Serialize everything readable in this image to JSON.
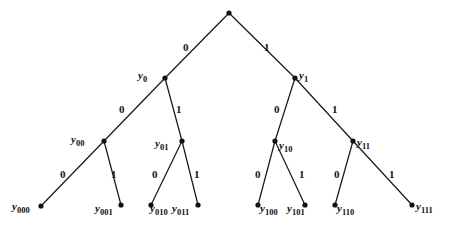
{
  "figure": {
    "type": "binary-tree-diagram",
    "background_color": "#ffffff",
    "line_color": "#1a1a1a",
    "node_color": "#111111",
    "width": 452,
    "height": 233
  },
  "nodes": [
    {
      "id": "root",
      "label": "",
      "sub": "",
      "x": 229,
      "y": 13,
      "label_x": 0,
      "label_y": 0,
      "level": 0
    },
    {
      "id": "y0",
      "label": "y",
      "sub": "0",
      "x": 165,
      "y": 78,
      "label_x": 138,
      "label_y": 70,
      "level": 1
    },
    {
      "id": "y1",
      "label": "y",
      "sub": "1",
      "x": 295,
      "y": 78,
      "label_x": 299,
      "label_y": 70,
      "level": 1
    },
    {
      "id": "y00",
      "label": "y",
      "sub": "00",
      "x": 104,
      "y": 141,
      "label_x": 71,
      "label_y": 134,
      "level": 2
    },
    {
      "id": "y01",
      "label": "y",
      "sub": "01",
      "x": 182,
      "y": 141,
      "label_x": 155,
      "label_y": 138,
      "level": 2
    },
    {
      "id": "y10",
      "label": "y",
      "sub": "10",
      "x": 275,
      "y": 141,
      "label_x": 279,
      "label_y": 140,
      "level": 2
    },
    {
      "id": "y11",
      "label": "y",
      "sub": "11",
      "x": 353,
      "y": 141,
      "label_x": 357,
      "label_y": 137,
      "level": 2
    },
    {
      "id": "y000",
      "label": "y",
      "sub": "000",
      "x": 41,
      "y": 206,
      "label_x": 12,
      "label_y": 201,
      "level": 3
    },
    {
      "id": "y001",
      "label": "y",
      "sub": "001",
      "x": 121,
      "y": 205,
      "label_x": 95,
      "label_y": 203,
      "level": 3
    },
    {
      "id": "y010",
      "label": "y",
      "sub": "010",
      "x": 151,
      "y": 205,
      "label_x": 150,
      "label_y": 203,
      "level": 3
    },
    {
      "id": "y011",
      "label": "y",
      "sub": "011",
      "x": 198,
      "y": 205,
      "label_x": 172,
      "label_y": 203,
      "level": 3
    },
    {
      "id": "y100",
      "label": "y",
      "sub": "100",
      "x": 258,
      "y": 205,
      "label_x": 260,
      "label_y": 203,
      "level": 3
    },
    {
      "id": "y101",
      "label": "y",
      "sub": "101",
      "x": 305,
      "y": 205,
      "label_x": 287,
      "label_y": 203,
      "level": 3
    },
    {
      "id": "y110",
      "label": "y",
      "sub": "110",
      "x": 335,
      "y": 205,
      "label_x": 337,
      "label_y": 203,
      "level": 3
    },
    {
      "id": "y111",
      "label": "y",
      "sub": "111",
      "x": 412,
      "y": 205,
      "label_x": 416,
      "label_y": 201,
      "level": 3
    }
  ],
  "edges": [
    {
      "id": "e-root-y0",
      "from": "root",
      "to": "y0",
      "label": "0",
      "x1": 229,
      "y1": 13,
      "x2": 165,
      "y2": 78,
      "label_x": 183,
      "label_y": 42
    },
    {
      "id": "e-root-y1",
      "from": "root",
      "to": "y1",
      "label": "1",
      "x1": 229,
      "y1": 13,
      "x2": 295,
      "y2": 78,
      "label_x": 264,
      "label_y": 42
    },
    {
      "id": "e-y0-y00",
      "from": "y0",
      "to": "y00",
      "label": "0",
      "x1": 165,
      "y1": 78,
      "x2": 104,
      "y2": 141,
      "label_x": 119,
      "label_y": 104
    },
    {
      "id": "e-y0-y01",
      "from": "y0",
      "to": "y01",
      "label": "1",
      "x1": 165,
      "y1": 78,
      "x2": 182,
      "y2": 141,
      "label_x": 176,
      "label_y": 104
    },
    {
      "id": "e-y1-y10",
      "from": "y1",
      "to": "y10",
      "label": "0",
      "x1": 295,
      "y1": 78,
      "x2": 275,
      "y2": 141,
      "label_x": 274,
      "label_y": 104
    },
    {
      "id": "e-y1-y11",
      "from": "y1",
      "to": "y11",
      "label": "1",
      "x1": 295,
      "y1": 78,
      "x2": 353,
      "y2": 141,
      "label_x": 332,
      "label_y": 104
    },
    {
      "id": "e-y00-y000",
      "from": "y00",
      "to": "y000",
      "label": "0",
      "x1": 104,
      "y1": 141,
      "x2": 41,
      "y2": 206,
      "label_x": 60,
      "label_y": 169
    },
    {
      "id": "e-y00-y001",
      "from": "y00",
      "to": "y001",
      "label": "1",
      "x1": 104,
      "y1": 141,
      "x2": 121,
      "y2": 205,
      "label_x": 111,
      "label_y": 169
    },
    {
      "id": "e-y01-y010",
      "from": "y01",
      "to": "y010",
      "label": "0",
      "x1": 182,
      "y1": 141,
      "x2": 151,
      "y2": 205,
      "label_x": 152,
      "label_y": 169
    },
    {
      "id": "e-y01-y011",
      "from": "y01",
      "to": "y011",
      "label": "1",
      "x1": 182,
      "y1": 141,
      "x2": 198,
      "y2": 205,
      "label_x": 194,
      "label_y": 169
    },
    {
      "id": "e-y10-y100",
      "from": "y10",
      "to": "y100",
      "label": "0",
      "x1": 275,
      "y1": 141,
      "x2": 258,
      "y2": 205,
      "label_x": 255,
      "label_y": 169
    },
    {
      "id": "e-y10-y101",
      "from": "y10",
      "to": "y101",
      "label": "1",
      "x1": 275,
      "y1": 141,
      "x2": 305,
      "y2": 205,
      "label_x": 299,
      "label_y": 169
    },
    {
      "id": "e-y11-y110",
      "from": "y11",
      "to": "y110",
      "label": "0",
      "x1": 353,
      "y1": 141,
      "x2": 335,
      "y2": 205,
      "label_x": 334,
      "label_y": 169
    },
    {
      "id": "e-y11-y111",
      "from": "y11",
      "to": "y111",
      "label": "1",
      "x1": 353,
      "y1": 141,
      "x2": 412,
      "y2": 205,
      "label_x": 389,
      "label_y": 169
    }
  ]
}
